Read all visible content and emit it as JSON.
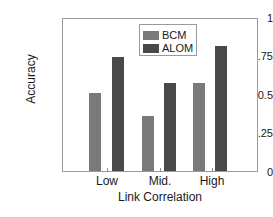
{
  "chart_data": {
    "type": "bar",
    "title": "",
    "subtitle": "",
    "xlabel": "Link Correlation",
    "ylabel": "Accuracy",
    "categories": [
      "Low",
      "Mid.",
      "High"
    ],
    "series": [
      {
        "name": "BCM",
        "values": [
          0.51,
          0.36,
          0.58
        ],
        "color": "#7a7a7a"
      },
      {
        "name": "ALOM",
        "values": [
          0.75,
          0.58,
          0.82
        ],
        "color": "#494949"
      }
    ],
    "ylim": [
      0,
      1
    ],
    "yticks": [
      0,
      0.25,
      0.5,
      0.75,
      1
    ],
    "ytick_labels": [
      "0",
      "0.25",
      "0.5",
      "0.75",
      "1"
    ],
    "xtick_labels": [
      "Low",
      "Mid.",
      "High"
    ],
    "grid": false,
    "legend_position": "top-center",
    "legend_entries": [
      "BCM",
      "ALOM"
    ],
    "annotations": []
  },
  "axes": {
    "y_label_text": "Accuracy",
    "x_label_text": "Link Correlation",
    "y_tick_0": "0",
    "y_tick_1": "0.25",
    "y_tick_2": "0.5",
    "y_tick_3": "0.75",
    "y_tick_4": "1",
    "x_tick_0": "Low",
    "x_tick_1": "Mid.",
    "x_tick_2": "High"
  },
  "legend": {
    "entry_0_label": "BCM",
    "entry_1_label": "ALOM",
    "entry_0_color": "#7a7a7a",
    "entry_1_color": "#494949"
  },
  "colors": {
    "bcm": "#7a7a7a",
    "alom": "#494949",
    "axis": "#9a9a9a",
    "text": "#1a1a1a",
    "background": "#ffffff"
  }
}
